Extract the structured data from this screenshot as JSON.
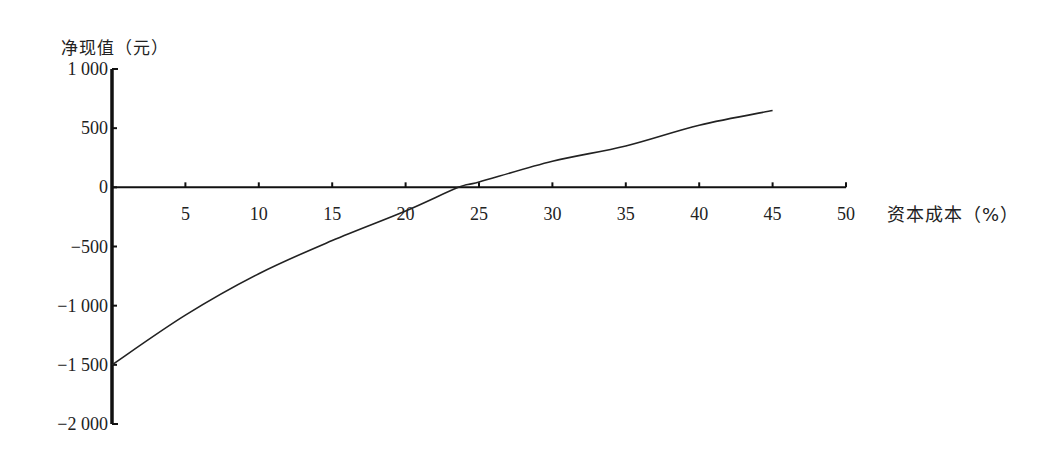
{
  "chart_data": {
    "type": "line",
    "title": "",
    "xlabel": "资本成本（%）",
    "ylabel": "净现值（元）",
    "xlim": [
      0,
      50
    ],
    "ylim": [
      -2000,
      1000
    ],
    "x_ticks": [
      5,
      10,
      15,
      20,
      25,
      30,
      35,
      40,
      45,
      50
    ],
    "x_tick_labels": [
      "5",
      "10",
      "15",
      "20",
      "25",
      "30",
      "35",
      "40",
      "45",
      "50"
    ],
    "y_ticks": [
      1000,
      500,
      0,
      -500,
      -1000,
      -1500,
      -2000
    ],
    "y_tick_labels": [
      "1 000",
      "500",
      "0",
      "−500",
      "−1 000",
      "−1 500",
      "−2 000"
    ],
    "grid": false,
    "legend": null,
    "series": [
      {
        "name": "净现值曲线",
        "x": [
          0,
          5,
          10,
          15,
          20,
          23.6,
          25,
          30,
          35,
          40,
          45
        ],
        "values": [
          -1500,
          -1080,
          -730,
          -450,
          -200,
          0,
          45,
          220,
          350,
          525,
          650
        ]
      }
    ],
    "annotations": []
  },
  "labels": {
    "y_axis_title": "净现值（元）",
    "x_axis_title": "资本成本（%）"
  }
}
